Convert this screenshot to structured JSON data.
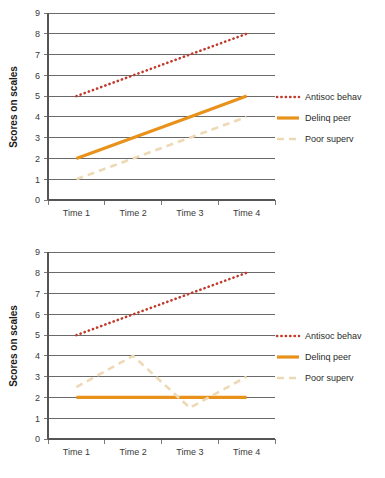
{
  "page": {
    "background": "#ffffff",
    "width": 385,
    "height": 478
  },
  "palette": {
    "antisoc": "#C0392B",
    "delinq": "#E8921C",
    "poor": "#EED9B6",
    "grid": "#6a6a6a",
    "axis": "#555555",
    "text": "#2b2b2b"
  },
  "legend": {
    "position": "right",
    "items": [
      {
        "key": "antisoc",
        "label": "Antisoc behav",
        "style": "dotted",
        "color": "#C0392B"
      },
      {
        "key": "delinq",
        "label": "Delinq peer",
        "style": "solid",
        "color": "#E8921C"
      },
      {
        "key": "poor",
        "label": "Poor superv",
        "style": "dashed",
        "color": "#EED9B6"
      }
    ]
  },
  "axes": {
    "ylabel": "Scores on scales",
    "yticks": [
      "9",
      "8",
      "7",
      "6",
      "5",
      "4",
      "3",
      "2",
      "1",
      "0"
    ],
    "ylim": [
      0,
      9
    ],
    "xticks": [
      "Time 1",
      "Time 2",
      "Time 3",
      "Time 4"
    ],
    "grid": true
  },
  "chart_data": [
    {
      "id": "chart-1",
      "type": "line",
      "title": "",
      "xlabel": "",
      "ylabel": "Scores on scales",
      "categories": [
        "Time 1",
        "Time 2",
        "Time 3",
        "Time 4"
      ],
      "ylim": [
        0,
        9
      ],
      "yticks": [
        0,
        1,
        2,
        3,
        4,
        5,
        6,
        7,
        8,
        9
      ],
      "grid": true,
      "legend_position": "right",
      "series": [
        {
          "name": "Antisoc behav",
          "style": "dotted",
          "color": "#C0392B",
          "values": [
            5,
            6,
            7,
            8
          ]
        },
        {
          "name": "Delinq peer",
          "style": "solid",
          "color": "#E8921C",
          "values": [
            2,
            3,
            4,
            5
          ]
        },
        {
          "name": "Poor superv",
          "style": "dashed",
          "color": "#EED9B6",
          "values": [
            1,
            2,
            3,
            4
          ]
        }
      ]
    },
    {
      "id": "chart-2",
      "type": "line",
      "title": "",
      "xlabel": "",
      "ylabel": "Scores on scales",
      "categories": [
        "Time 1",
        "Time 2",
        "Time 3",
        "Time 4"
      ],
      "ylim": [
        0,
        9
      ],
      "yticks": [
        0,
        1,
        2,
        3,
        4,
        5,
        6,
        7,
        8,
        9
      ],
      "grid": true,
      "legend_position": "right",
      "series": [
        {
          "name": "Antisoc behav",
          "style": "dotted",
          "color": "#C0392B",
          "values": [
            5,
            6,
            7,
            8
          ]
        },
        {
          "name": "Delinq peer",
          "style": "solid",
          "color": "#E8921C",
          "values": [
            2,
            2,
            2,
            2
          ]
        },
        {
          "name": "Poor superv",
          "style": "dashed",
          "color": "#EED9B6",
          "values": [
            2.5,
            4,
            1.5,
            3
          ]
        }
      ]
    }
  ],
  "geometry": {
    "plot_left": 48,
    "plot_right": 275,
    "plot_top": 13,
    "plot_bottom": 200,
    "legend_x_line_start": 277,
    "legend_x_line_end": 299,
    "legend_x_text": 305,
    "legend_y_first": 97,
    "legend_y_step": 21
  }
}
